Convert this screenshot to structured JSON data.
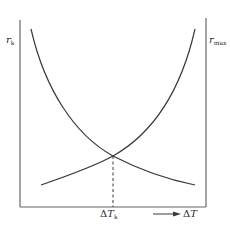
{
  "diagram": {
    "title": "",
    "left_axis": {
      "label_main": "r",
      "label_sub": "k"
    },
    "right_axis": {
      "label_main": "r",
      "label_sub": "max"
    },
    "x_axis": {
      "label_delta": "Δ",
      "label_main": "T",
      "arrow": "arrow-right"
    },
    "intersection": {
      "label_delta": "Δ",
      "label_main": "T",
      "label_sub": "k"
    },
    "curves": [
      {
        "name": "r_k",
        "shape": "decreasing-convex"
      },
      {
        "name": "r_max",
        "shape": "increasing-convex"
      }
    ],
    "colors": {
      "line": "#3a3a3a",
      "axis": "#555555",
      "background": "#ffffff"
    }
  }
}
